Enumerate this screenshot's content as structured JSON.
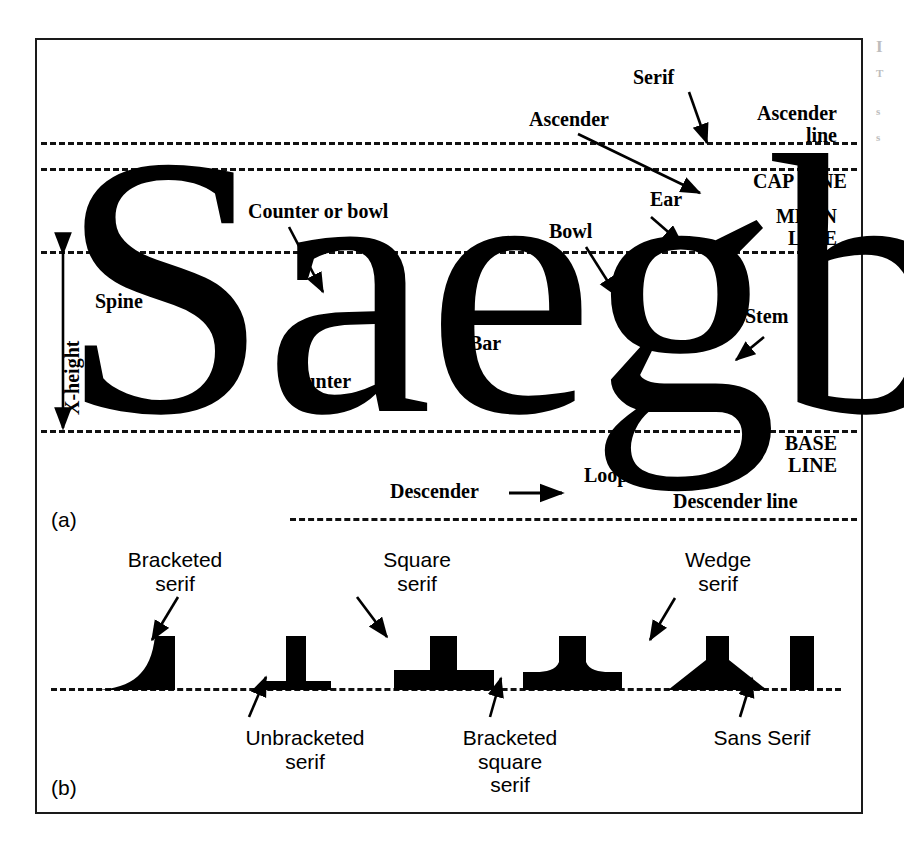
{
  "figure": {
    "panel_a": {
      "caption": "(a)",
      "letters": "Saegb",
      "guide_lines": [
        {
          "id": "ascender-line",
          "label": "Ascender\nline"
        },
        {
          "id": "cap-line",
          "label": "CAP LINE"
        },
        {
          "id": "mean-line",
          "label": "MEAN\nLINE"
        },
        {
          "id": "base-line",
          "label": "BASE\nLINE"
        },
        {
          "id": "descender-line",
          "label": "Descender line"
        }
      ],
      "callouts": [
        {
          "id": "serif",
          "label": "Serif"
        },
        {
          "id": "ascender",
          "label": "Ascender"
        },
        {
          "id": "ear",
          "label": "Ear"
        },
        {
          "id": "bowl",
          "label": "Bowl"
        },
        {
          "id": "counter-or-bowl",
          "label": "Counter or bowl"
        },
        {
          "id": "counter",
          "label": "Counter"
        },
        {
          "id": "bar",
          "label": "Bar"
        },
        {
          "id": "spine",
          "label": "Spine"
        },
        {
          "id": "stem",
          "label": "Stem"
        },
        {
          "id": "loop",
          "label": "Loop"
        },
        {
          "id": "descender",
          "label": "Descender"
        },
        {
          "id": "x-height",
          "label": "X-height"
        }
      ]
    },
    "panel_b": {
      "caption": "(b)",
      "specimens": [
        {
          "id": "bracketed-serif",
          "label": "Bracketed\nserif",
          "position": "above"
        },
        {
          "id": "unbracketed-serif",
          "label": "Unbracketed\nserif",
          "position": "below"
        },
        {
          "id": "square-serif",
          "label": "Square\nserif",
          "position": "above"
        },
        {
          "id": "bracketed-square-serif",
          "label": "Bracketed\nsquare\nserif",
          "position": "below"
        },
        {
          "id": "wedge-serif",
          "label": "Wedge\nserif",
          "position": "above"
        },
        {
          "id": "sans-serif",
          "label": "Sans Serif",
          "position": "below"
        }
      ]
    }
  },
  "margin_note": {
    "line1": "I",
    "line2": "T",
    "line3": "s",
    "line4": "s"
  },
  "colors": {
    "ink": "#000000",
    "frame": "#1a1a1a",
    "paper": "#ffffff"
  }
}
